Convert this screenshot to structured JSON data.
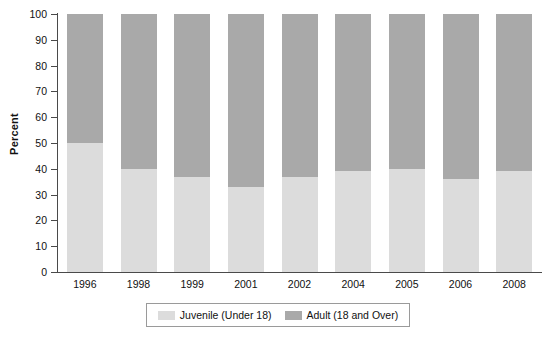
{
  "chart_data": {
    "type": "bar",
    "stacked": true,
    "title": "",
    "xlabel": "",
    "ylabel": "Percent",
    "ylim": [
      0,
      100
    ],
    "yticks": [
      0,
      10,
      20,
      30,
      40,
      50,
      60,
      70,
      80,
      90,
      100
    ],
    "grid": false,
    "legend_position": "bottom",
    "categories": [
      "1996",
      "1998",
      "1999",
      "2001",
      "2002",
      "2004",
      "2005",
      "2006",
      "2008"
    ],
    "series": [
      {
        "name": "Juvenile (Under 18)",
        "color": "#dcdcdc",
        "values": [
          50,
          40,
          37,
          33,
          37,
          39,
          40,
          36,
          39
        ]
      },
      {
        "name": "Adult (18 and Over)",
        "color": "#a9a9a9",
        "values": [
          50,
          60,
          63,
          67,
          63,
          61,
          60,
          64,
          61
        ]
      }
    ]
  },
  "legend": {
    "entries": [
      {
        "label": "Juvenile (Under 18)",
        "color": "#dcdcdc"
      },
      {
        "label": "Adult (18 and Over)",
        "color": "#a9a9a9"
      }
    ]
  },
  "axes": {
    "y_title": "Percent",
    "y_tick_labels": [
      "100",
      "90",
      "80",
      "70",
      "60",
      "50",
      "40",
      "30",
      "20",
      "10",
      "0"
    ],
    "x_tick_labels": [
      "1996",
      "1998",
      "1999",
      "2001",
      "2002",
      "2004",
      "2005",
      "2006",
      "2008"
    ]
  },
  "colors": {
    "juvenile": "#dcdcdc",
    "adult": "#a9a9a9",
    "axis": "#4a4a4a",
    "text": "#111111",
    "background": "#ffffff"
  }
}
